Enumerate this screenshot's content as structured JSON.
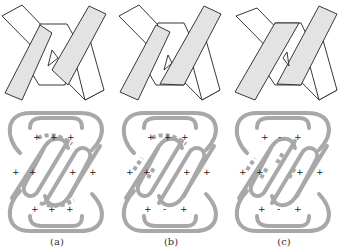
{
  "figure": {
    "colors": {
      "band_fill_white": "#ffffff",
      "band_fill_gray": "#e3e3e3",
      "band_stroke": "#222222",
      "knot_stroke": "#a8a8a8",
      "sign_color": "#222222"
    },
    "panels": [
      {
        "id": "a",
        "caption": "(a)",
        "signs": {
          "top": [
            "+",
            "+",
            "+"
          ],
          "middle_left": [
            "+",
            "+"
          ],
          "middle_right": [
            "+",
            "+"
          ],
          "bottom": [
            "+",
            "+",
            "+"
          ]
        }
      },
      {
        "id": "b",
        "caption": "(b)",
        "signs": {
          "top": [
            "+",
            "+",
            "+"
          ],
          "middle_left": [
            "+",
            "+"
          ],
          "middle_right": [
            "+",
            "+"
          ],
          "bottom": [
            "+",
            "-",
            "+"
          ]
        }
      },
      {
        "id": "c",
        "caption": "(c)",
        "signs": {
          "top": [
            "+",
            "-",
            "+"
          ],
          "middle_left": [
            "+",
            "+"
          ],
          "middle_right": [
            "+",
            "+"
          ],
          "bottom": [
            "+",
            "-",
            "+"
          ]
        }
      }
    ]
  }
}
